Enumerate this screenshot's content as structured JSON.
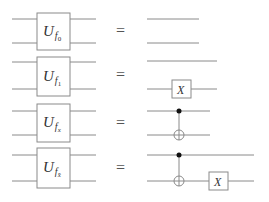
{
  "diagram": {
    "equals_symbol": "=",
    "rows": [
      {
        "gate_label": "U",
        "subscript_base": "f",
        "subscript_index": "0",
        "equivalent": "identity (two plain wires)",
        "right_gates": []
      },
      {
        "gate_label": "U",
        "subscript_base": "f",
        "subscript_index": "1",
        "equivalent": "X on target wire",
        "right_gates": [
          {
            "type": "X",
            "label": "X"
          }
        ]
      },
      {
        "gate_label": "U",
        "subscript_base": "f",
        "subscript_index": "x",
        "equivalent": "CNOT",
        "right_gates": [
          {
            "type": "CNOT"
          }
        ]
      },
      {
        "gate_label": "U",
        "subscript_base": "f",
        "subscript_index": "x̄",
        "equivalent": "CNOT followed by X on target",
        "right_gates": [
          {
            "type": "CNOT"
          },
          {
            "type": "X",
            "label": "X"
          }
        ]
      }
    ]
  }
}
